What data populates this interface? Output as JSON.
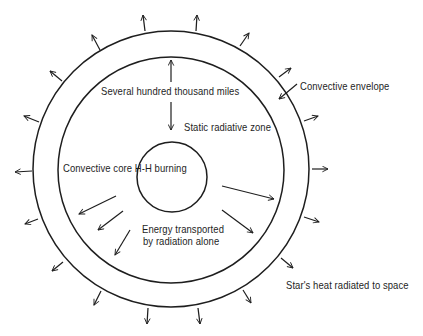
{
  "diagram": {
    "labels": {
      "distance": "Several hundred thousand miles",
      "radiative_zone": "Static radiative zone",
      "convective_envelope": "Convective envelope",
      "convective_core": "Convective core H-H burning",
      "energy_line1": "Energy transported",
      "energy_line2": "by radiation alone",
      "space": "Star's heat radiated to space"
    },
    "colors": {
      "stroke": "#1e1e1e",
      "background": "#ffffff"
    },
    "geometry": {
      "outer_circle": {
        "cx": 171,
        "cy": 169,
        "r": 138
      },
      "inner_circle": {
        "cx": 171,
        "cy": 170,
        "r": 113
      },
      "core_circle": {
        "cx": 172,
        "cy": 177,
        "r": 35
      }
    }
  }
}
